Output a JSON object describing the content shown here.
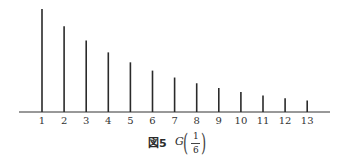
{
  "chart_data": {
    "type": "bar",
    "figure_label": "図5",
    "distribution": "G",
    "parameter": {
      "numerator": "1",
      "denominator": "6"
    },
    "xlabel": "",
    "ylabel": "",
    "categories": [
      "1",
      "2",
      "3",
      "4",
      "5",
      "6",
      "7",
      "8",
      "9",
      "10",
      "11",
      "12",
      "13"
    ],
    "values": [
      0.1667,
      0.1389,
      0.1157,
      0.0965,
      0.0804,
      0.067,
      0.0558,
      0.0465,
      0.0388,
      0.0323,
      0.0269,
      0.0224,
      0.0187
    ],
    "bar_style": "thin vertical lines (stem plot)",
    "grid": false,
    "legend": null,
    "ylim": [
      0,
      0.17
    ]
  },
  "caption": {
    "fig": "図5",
    "G": "G",
    "num": "1",
    "den": "6",
    "lparen": "(",
    "rparen": ")"
  },
  "colors": {
    "ink": "#2a2a2a",
    "background": "#ffffff"
  }
}
